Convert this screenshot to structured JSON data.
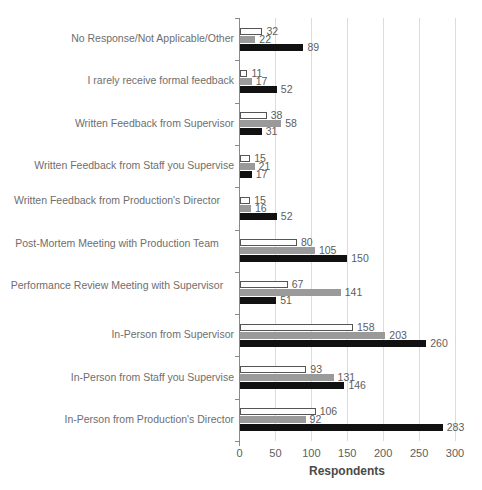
{
  "chart_data": {
    "type": "bar",
    "orientation": "horizontal",
    "title": "",
    "xlabel": "Respondents",
    "ylabel": "",
    "xlim": [
      0,
      300
    ],
    "xticks": [
      0,
      50,
      100,
      150,
      200,
      250,
      300
    ],
    "grid": true,
    "legend": "none",
    "categories": [
      "No Response/Not Applicable/Other",
      "I rarely receive formal feedback",
      "Written Feedback from Supervisor",
      "Written Feedback from Staff  you Supervise",
      "Written Feedback from Production's Director",
      "Post-Mortem Meeting with Production Team",
      "Performance Review Meeting with Supervisor",
      "In-Person from Supervisor",
      "In-Person from Staff  you Supervise",
      "In-Person from Production's Director"
    ],
    "series": [
      {
        "name": "series-1",
        "color": "#fdfdfd",
        "values": [
          32,
          11,
          38,
          15,
          15,
          80,
          67,
          158,
          93,
          106
        ]
      },
      {
        "name": "series-2",
        "color": "#9a9a9a",
        "values": [
          22,
          17,
          58,
          21,
          16,
          105,
          141,
          203,
          131,
          92
        ]
      },
      {
        "name": "series-3",
        "color": "#111111",
        "values": [
          89,
          52,
          31,
          17,
          52,
          150,
          51,
          260,
          146,
          283
        ]
      }
    ]
  }
}
